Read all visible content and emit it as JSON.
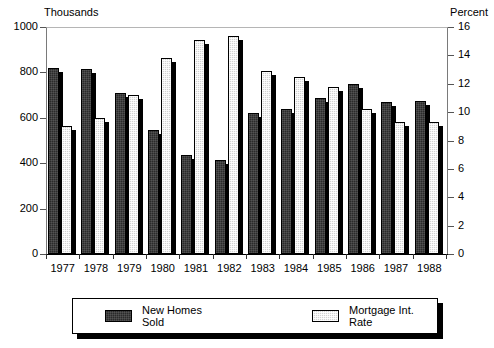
{
  "chart_data": {
    "type": "bar",
    "title": "",
    "categories": [
      "1977",
      "1978",
      "1979",
      "1980",
      "1981",
      "1982",
      "1983",
      "1984",
      "1985",
      "1986",
      "1987",
      "1988"
    ],
    "series": [
      {
        "name": "New Homes Sold",
        "axis": "left",
        "color": "#2a2a2a",
        "values": [
          819,
          817,
          709,
          545,
          436,
          412,
          623,
          639,
          688,
          750,
          671,
          676
        ]
      },
      {
        "name": "Mortgage Int. Rate",
        "axis": "right",
        "color": "#d2d2d2",
        "values": [
          9.0,
          9.6,
          11.2,
          13.8,
          15.1,
          15.4,
          12.9,
          12.5,
          11.8,
          10.2,
          9.3,
          9.3
        ]
      }
    ],
    "left_axis": {
      "label": "Thousands",
      "ticks": [
        "0",
        "200",
        "400",
        "600",
        "800",
        "1000"
      ],
      "lim": [
        0,
        1000
      ]
    },
    "right_axis": {
      "label": "Percent",
      "ticks": [
        "0",
        "2",
        "4",
        "6",
        "8",
        "10",
        "12",
        "14",
        "16"
      ],
      "lim": [
        0,
        16
      ]
    },
    "xlabel": "",
    "grid": false,
    "legend_position": "bottom"
  },
  "legend": {
    "items": [
      {
        "label": "New Homes Sold",
        "swatch": "dark-swatch-icon"
      },
      {
        "label": "Mortgage Int. Rate",
        "swatch": "light-swatch-icon"
      }
    ]
  }
}
